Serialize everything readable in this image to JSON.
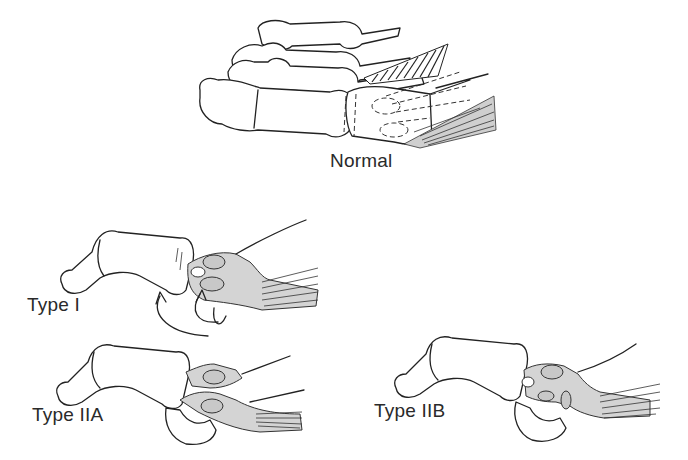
{
  "figure": {
    "panels": [
      {
        "id": "normal",
        "label": "Normal"
      },
      {
        "id": "type-1",
        "label": "Type I"
      },
      {
        "id": "type-2a",
        "label": "Type IIA"
      },
      {
        "id": "type-2b",
        "label": "Type IIB"
      }
    ],
    "colors": {
      "line": "#222222",
      "fill_gray": "#cfcfcf",
      "background": "#ffffff"
    }
  }
}
